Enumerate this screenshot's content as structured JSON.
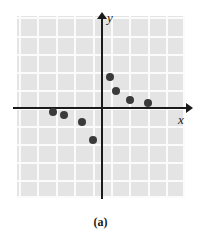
{
  "figure": {
    "caption": "(a)",
    "axis_labels": {
      "x": "x",
      "y": "y"
    },
    "colors": {
      "panel": "#e4e4e4",
      "grid": "#fbfbfb",
      "axis": "#1a1a1a",
      "point": "#3a3a3a",
      "background": "#ffffff"
    }
  },
  "chart_data": {
    "type": "scatter",
    "title": "",
    "subtitle": "",
    "xlabel": "x",
    "ylabel": "y",
    "grid": true,
    "legend": "none",
    "xlim": [
      -5.5,
      5.0
    ],
    "ylim": [
      -5.0,
      5.5
    ],
    "grid_spacing": {
      "x": 1,
      "y": 1
    },
    "origin_px": {
      "x": 102,
      "y": 108
    },
    "px_per_unit": 18,
    "series": [
      {
        "name": "data",
        "marker": "filled-circle",
        "color": "#3a3a3a",
        "points": [
          {
            "x": -2.7,
            "y": -0.2
          },
          {
            "x": -2.1,
            "y": -0.4
          },
          {
            "x": -1.1,
            "y": -0.8
          },
          {
            "x": -0.5,
            "y": -1.8
          },
          {
            "x": 0.45,
            "y": 1.7
          },
          {
            "x": 0.8,
            "y": 0.95
          },
          {
            "x": 1.55,
            "y": 0.45
          },
          {
            "x": 2.55,
            "y": 0.3
          }
        ]
      }
    ],
    "annotations": []
  }
}
